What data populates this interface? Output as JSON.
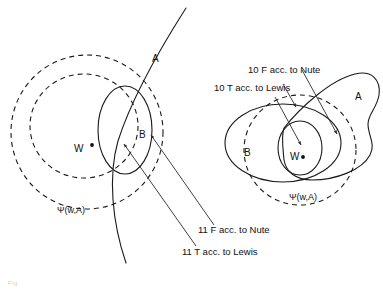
{
  "figure": {
    "background_color": "#ffffff",
    "ink_color": "#1a1a1a",
    "caption_fragment": "Fig"
  },
  "left_diagram": {
    "name": "left-panel",
    "set_labels": {
      "a": "A",
      "b": "B",
      "w": "W",
      "psi": "Ψ(w,A)"
    },
    "annotations": [
      {
        "id": "left-nute",
        "text": "11 F acc. to Nute",
        "value": "11",
        "truth": "F",
        "theorist": "Nute"
      },
      {
        "id": "left-lewis",
        "text": "11 T acc. to Lewis",
        "value": "11",
        "truth": "T",
        "theorist": "Lewis"
      }
    ]
  },
  "right_diagram": {
    "name": "right-panel",
    "set_labels": {
      "a": "A",
      "b": "B",
      "w": "W",
      "psi": "Ψ(w,A)"
    },
    "annotations": [
      {
        "id": "right-nute",
        "text": "10 F acc. to Nute",
        "value": "10",
        "truth": "F",
        "theorist": "Nute"
      },
      {
        "id": "right-lewis",
        "text": "10 T acc. to Lewis",
        "value": "10",
        "truth": "T",
        "theorist": "Lewis"
      }
    ]
  }
}
